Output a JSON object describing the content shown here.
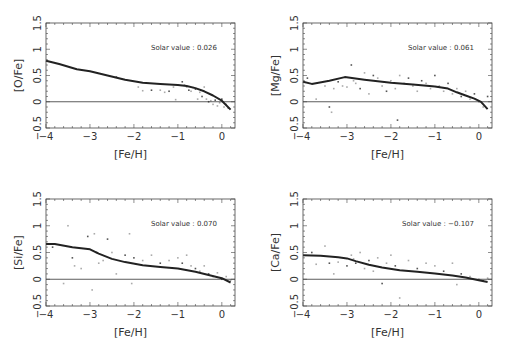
{
  "figure": {
    "panel_count": 4,
    "colors": {
      "curve": "#222222",
      "points_dark": "#555555",
      "points_light": "#aaaaaa",
      "frame": "#444444",
      "zero_line": "#333333"
    }
  },
  "chart_data": [
    {
      "type": "scatter",
      "title": "",
      "xlabel": "[Fe/H]",
      "ylabel": "[O/Fe]",
      "xlim": [
        -4,
        0.3
      ],
      "ylim": [
        -0.5,
        1.5
      ],
      "xticks": [
        "−4",
        "−3",
        "−2",
        "−1",
        "0"
      ],
      "yticks": [
        "−0.5",
        "0",
        "0.5",
        "1",
        "1.5"
      ],
      "annotation": "Solar value :  0.026",
      "reference_line_y": 0,
      "grid": false,
      "model_curve": {
        "x": [
          -4,
          -3.7,
          -3.3,
          -3,
          -2.6,
          -2.2,
          -1.8,
          -1.4,
          -1.0,
          -0.8,
          -0.6,
          -0.4,
          -0.2,
          0,
          0.2
        ],
        "y": [
          0.78,
          0.72,
          0.62,
          0.58,
          0.5,
          0.42,
          0.36,
          0.34,
          0.32,
          0.3,
          0.26,
          0.2,
          0.12,
          0.02,
          -0.15
        ]
      },
      "scatter_points": {
        "x": [
          -2.4,
          -1.9,
          -1.8,
          -1.6,
          -1.4,
          -1.3,
          -1.2,
          -1.1,
          -1.05,
          -0.9,
          -0.85,
          -0.8,
          -0.75,
          -0.7,
          -0.65,
          -0.6,
          -0.55,
          -0.5,
          -0.45,
          -0.4,
          -0.35,
          -0.3,
          -0.25,
          -0.2,
          -0.15,
          -0.1,
          -0.05,
          0,
          0.05,
          0.1,
          0.15
        ],
        "y": [
          0.47,
          0.28,
          0.21,
          0.22,
          0.22,
          0.18,
          0.2,
          0.28,
          0.04,
          0.38,
          0.32,
          0.28,
          0.22,
          0.2,
          0.27,
          0.24,
          0.05,
          0.18,
          0.1,
          0.28,
          0.05,
          0.0,
          0.02,
          -0.05,
          0.03,
          -0.08,
          -0.02,
          0.05,
          -0.1,
          -0.05,
          -0.12
        ]
      }
    },
    {
      "type": "scatter",
      "title": "",
      "xlabel": "[Fe/H]",
      "ylabel": "[Mg/Fe]",
      "xlim": [
        -4,
        0.3
      ],
      "ylim": [
        -0.5,
        1.5
      ],
      "xticks": [
        "−4",
        "−3",
        "−2",
        "−1",
        "0"
      ],
      "yticks": [
        "−0.5",
        "0",
        "0.5",
        "1",
        "1.5"
      ],
      "annotation": "Solar value :  0.061",
      "reference_line_y": 0,
      "grid": false,
      "model_curve": {
        "x": [
          -4,
          -3.8,
          -3.4,
          -3.05,
          -2.6,
          -2.0,
          -1.5,
          -1.0,
          -0.7,
          -0.5,
          -0.3,
          -0.1,
          0.05,
          0.2
        ],
        "y": [
          0.38,
          0.34,
          0.4,
          0.47,
          0.42,
          0.36,
          0.33,
          0.29,
          0.25,
          0.18,
          0.12,
          0.06,
          0.0,
          -0.14
        ]
      },
      "scatter_points": {
        "x": [
          -3.9,
          -3.7,
          -3.5,
          -3.4,
          -3.35,
          -3.3,
          -3.2,
          -3.1,
          -3.0,
          -2.9,
          -2.85,
          -2.8,
          -2.7,
          -2.6,
          -2.5,
          -2.4,
          -2.3,
          -2.2,
          -2.1,
          -2.0,
          -1.9,
          -1.85,
          -1.8,
          -1.7,
          -1.6,
          -1.5,
          -1.4,
          -1.3,
          -1.2,
          -1.1,
          -1.0,
          -0.9,
          -0.8,
          -0.7,
          -0.6,
          -0.5,
          -0.4,
          -0.3,
          -0.2,
          -0.1,
          0.0,
          0.1,
          0.2
        ],
        "y": [
          0.45,
          0.05,
          0.3,
          -0.1,
          -0.2,
          0.25,
          0.38,
          0.3,
          0.28,
          0.7,
          0.4,
          0.35,
          0.25,
          0.55,
          0.15,
          0.5,
          0.45,
          0.3,
          0.2,
          0.4,
          0.25,
          -0.35,
          0.5,
          0.35,
          0.45,
          0.3,
          0.2,
          0.4,
          0.35,
          0.25,
          0.5,
          0.3,
          0.2,
          0.35,
          0.15,
          0.25,
          0.1,
          0.2,
          0.05,
          0.15,
          0.0,
          -0.1,
          0.1
        ]
      }
    },
    {
      "type": "scatter",
      "title": "",
      "xlabel": "[Fe/H]",
      "ylabel": "[Si/Fe]",
      "xlim": [
        -4,
        0.3
      ],
      "ylim": [
        -0.5,
        1.5
      ],
      "xticks": [
        "−4",
        "−3",
        "−2",
        "−1",
        "0"
      ],
      "yticks": [
        "−0.5",
        "0",
        "0.5",
        "1",
        "1.5"
      ],
      "annotation": "Solar value :  0.070",
      "reference_line_y": 0,
      "grid": false,
      "model_curve": {
        "x": [
          -4,
          -3.8,
          -3.4,
          -3.0,
          -2.8,
          -2.5,
          -2.2,
          -1.8,
          -1.4,
          -1.0,
          -0.6,
          -0.3,
          0,
          0.2
        ],
        "y": [
          0.66,
          0.66,
          0.6,
          0.56,
          0.48,
          0.38,
          0.32,
          0.26,
          0.23,
          0.2,
          0.14,
          0.08,
          0.02,
          -0.06
        ]
      },
      "scatter_points": {
        "x": [
          -3.85,
          -3.6,
          -3.5,
          -3.4,
          -3.35,
          -3.2,
          -3.05,
          -2.95,
          -2.9,
          -2.85,
          -2.8,
          -2.7,
          -2.6,
          -2.5,
          -2.4,
          -2.2,
          -2.1,
          -2.05,
          -2.0,
          -1.8,
          -1.6,
          -1.4,
          -1.2,
          -1.0,
          -0.9,
          -0.8,
          -0.7,
          -0.6,
          -0.5,
          -0.4,
          -0.3,
          -0.2,
          -0.1,
          0.0,
          0.1,
          0.2
        ],
        "y": [
          0.6,
          -0.08,
          1.0,
          0.4,
          0.25,
          0.2,
          0.8,
          -0.2,
          0.85,
          0.5,
          0.3,
          0.35,
          0.75,
          0.5,
          0.1,
          0.45,
          0.85,
          -0.08,
          0.4,
          0.35,
          0.45,
          0.3,
          0.35,
          0.4,
          0.3,
          0.45,
          0.25,
          0.2,
          0.15,
          0.25,
          0.1,
          0.05,
          0.12,
          0.0,
          0.05,
          -0.02
        ]
      }
    },
    {
      "type": "scatter",
      "title": "",
      "xlabel": "[Fe/H]",
      "ylabel": "[Ca/Fe]",
      "xlim": [
        -4,
        0.3
      ],
      "ylim": [
        -0.5,
        1.5
      ],
      "xticks": [
        "−4",
        "−3",
        "−2",
        "−1",
        "0"
      ],
      "yticks": [
        "−0.5",
        "0",
        "0.5",
        "1",
        "1.5"
      ],
      "annotation": "Solar value : −0.107",
      "reference_line_y": 0,
      "grid": false,
      "model_curve": {
        "x": [
          -4,
          -3.6,
          -3.2,
          -3.0,
          -2.8,
          -2.5,
          -2.2,
          -1.8,
          -1.4,
          -1.0,
          -0.6,
          -0.3,
          0,
          0.2
        ],
        "y": [
          0.45,
          0.44,
          0.41,
          0.39,
          0.34,
          0.27,
          0.22,
          0.17,
          0.14,
          0.11,
          0.07,
          0.03,
          -0.02,
          -0.05
        ]
      },
      "scatter_points": {
        "x": [
          -3.8,
          -3.7,
          -3.5,
          -3.4,
          -3.3,
          -3.2,
          -3.0,
          -2.9,
          -2.85,
          -2.8,
          -2.7,
          -2.6,
          -2.5,
          -2.4,
          -2.3,
          -2.2,
          -2.1,
          -2.0,
          -1.9,
          -1.8,
          -1.6,
          -1.4,
          -1.2,
          -1.0,
          -0.8,
          -0.6,
          -0.5,
          -0.4,
          -0.2,
          0.0,
          0.1,
          0.2
        ],
        "y": [
          0.5,
          0.28,
          0.62,
          0.3,
          0.1,
          0.32,
          0.25,
          0.45,
          0.38,
          0.3,
          0.5,
          0.2,
          0.35,
          0.15,
          0.4,
          -0.08,
          0.3,
          0.45,
          0.25,
          -0.35,
          0.35,
          0.2,
          0.3,
          0.25,
          0.15,
          0.3,
          -0.1,
          0.1,
          0.05,
          0.0,
          -0.03,
          0.02
        ]
      }
    }
  ],
  "panels": [
    {
      "frame": {
        "left": 46,
        "top": 23,
        "right": 235,
        "bottom": 128
      }
    },
    {
      "frame": {
        "left": 303,
        "top": 23,
        "right": 492,
        "bottom": 128
      }
    },
    {
      "frame": {
        "left": 46,
        "top": 199,
        "right": 235,
        "bottom": 306
      }
    },
    {
      "frame": {
        "left": 303,
        "top": 199,
        "right": 492,
        "bottom": 306
      }
    }
  ]
}
